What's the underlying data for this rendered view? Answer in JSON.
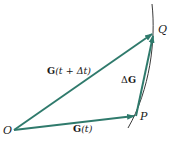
{
  "diagram": {
    "type": "vector-diagram",
    "colors": {
      "vector": "#2f7a6c",
      "curve": "#3a3a3a",
      "text": "#1a1a1a",
      "background": "#ffffff"
    },
    "points": {
      "origin": {
        "label": "O",
        "x": 14,
        "y": 130
      },
      "p": {
        "label": "P",
        "x": 136,
        "y": 116
      },
      "q": {
        "label": "Q",
        "x": 154,
        "y": 33
      }
    },
    "vectors": [
      {
        "name": "G(t)",
        "bold": "G",
        "rest": "(t)",
        "from": "O",
        "to": "P"
      },
      {
        "name": "G(t + Δt)",
        "bold": "G",
        "rest": "(t + Δt)",
        "from": "O",
        "to": "Q"
      },
      {
        "name": "ΔG",
        "prefix": "Δ",
        "bold": "G",
        "from": "P",
        "to": "Q"
      }
    ],
    "labels": {
      "o": "O",
      "p": "P",
      "q": "Q",
      "g_t_bold": "G",
      "g_t_rest": "(t)",
      "g_tdt_bold": "G",
      "g_tdt_rest": "(t + Δt)",
      "dg_prefix": "Δ",
      "dg_bold": "G"
    }
  }
}
